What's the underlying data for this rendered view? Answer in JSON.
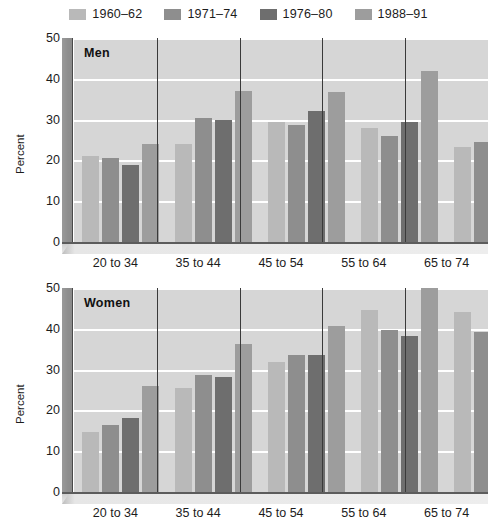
{
  "legend": {
    "items": [
      {
        "label": "1960–62",
        "color": "#b9b9b9"
      },
      {
        "label": "1971–74",
        "color": "#8e8e8e"
      },
      {
        "label": "1976–80",
        "color": "#6e6e6e"
      },
      {
        "label": "1988–91",
        "color": "#9d9d9d"
      }
    ]
  },
  "chart_data": {
    "type": "bar",
    "title": "",
    "panels": [
      {
        "title": "Men",
        "ylabel": "Percent",
        "xlabel": "",
        "ylim": [
          0,
          50
        ],
        "yticks": [
          0,
          10,
          20,
          30,
          40,
          50
        ],
        "grid": true,
        "categories": [
          "20 to 34",
          "35 to 44",
          "45 to 54",
          "55 to 64",
          "65 to 74"
        ],
        "series": [
          {
            "name": "1960–62",
            "values": [
              21.0,
              24.0,
              29.4,
              28.0,
              23.3
            ]
          },
          {
            "name": "1971–74",
            "values": [
              20.5,
              30.5,
              28.8,
              26.0,
              24.4
            ]
          },
          {
            "name": "1976–80",
            "values": [
              18.8,
              30.0,
              32.0,
              29.3,
              26.3
            ]
          },
          {
            "name": "1988–91",
            "values": [
              24.0,
              37.0,
              36.8,
              41.8,
              43.5
            ]
          }
        ]
      },
      {
        "title": "Women",
        "ylabel": "Percent",
        "xlabel": "",
        "ylim": [
          0,
          50
        ],
        "yticks": [
          0,
          10,
          20,
          30,
          40,
          50
        ],
        "grid": true,
        "categories": [
          "20 to 34",
          "35 to 44",
          "45 to 54",
          "55 to 64",
          "65 to 74"
        ],
        "series": [
          {
            "name": "1960–62",
            "values": [
              14.8,
              25.4,
              31.9,
              44.6,
              44.2
            ]
          },
          {
            "name": "1971–74",
            "values": [
              16.4,
              28.8,
              33.5,
              39.8,
              39.3
            ]
          },
          {
            "name": "1976–80",
            "values": [
              18.1,
              28.3,
              33.6,
              38.3,
              39.6
            ]
          },
          {
            "name": "1988–91",
            "values": [
              25.9,
              36.4,
              40.8,
              50.3,
              40.7
            ]
          }
        ]
      }
    ],
    "legend_position": "top"
  }
}
